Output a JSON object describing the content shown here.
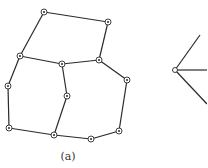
{
  "figure": {
    "caption_a": "(a)",
    "colors": {
      "line": "#2a2a2a",
      "background": "#ffffff"
    },
    "graph_a": {
      "nodes": [
        {
          "id": "n1",
          "x": 44,
          "y": 12
        },
        {
          "id": "n2",
          "x": 108,
          "y": 22
        },
        {
          "id": "n3",
          "x": 20,
          "y": 56
        },
        {
          "id": "n4",
          "x": 62,
          "y": 64
        },
        {
          "id": "n5",
          "x": 99,
          "y": 60
        },
        {
          "id": "n6",
          "x": 8,
          "y": 86
        },
        {
          "id": "n7",
          "x": 127,
          "y": 80
        },
        {
          "id": "n8",
          "x": 67,
          "y": 96
        },
        {
          "id": "n9",
          "x": 9,
          "y": 128
        },
        {
          "id": "n10",
          "x": 54,
          "y": 135
        },
        {
          "id": "n11",
          "x": 91,
          "y": 139
        },
        {
          "id": "n12",
          "x": 119,
          "y": 131
        }
      ],
      "edges": [
        [
          "n1",
          "n2"
        ],
        [
          "n1",
          "n3"
        ],
        [
          "n2",
          "n5"
        ],
        [
          "n3",
          "n4"
        ],
        [
          "n4",
          "n5"
        ],
        [
          "n3",
          "n6"
        ],
        [
          "n6",
          "n9"
        ],
        [
          "n9",
          "n10"
        ],
        [
          "n4",
          "n8"
        ],
        [
          "n8",
          "n10"
        ],
        [
          "n10",
          "n11"
        ],
        [
          "n11",
          "n12"
        ],
        [
          "n12",
          "n7"
        ],
        [
          "n7",
          "n5"
        ]
      ]
    },
    "graph_b_partial": {
      "vertex": {
        "x": 175,
        "y": 70
      },
      "rays_to": [
        {
          "x": 200,
          "y": 35
        },
        {
          "x": 207,
          "y": 70
        },
        {
          "x": 207,
          "y": 104
        }
      ]
    }
  }
}
